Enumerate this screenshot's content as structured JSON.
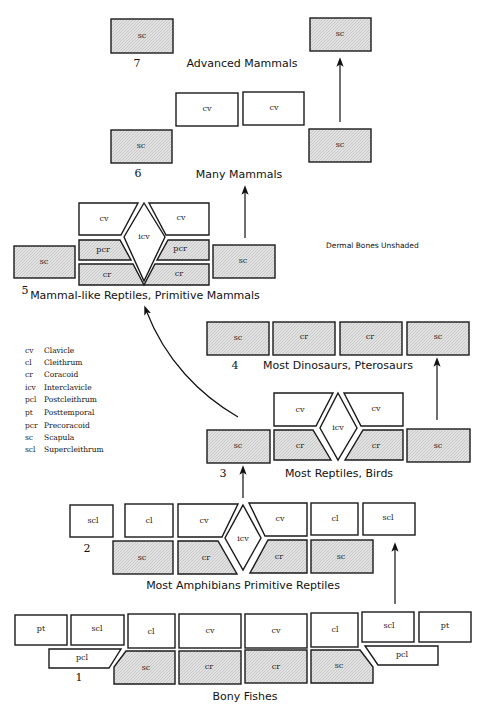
{
  "figure": {
    "note": "Dermal Bones Unshaded",
    "stages": [
      {
        "number": "7",
        "title": "Advanced Mammals"
      },
      {
        "number": "6",
        "title": "Many Mammals"
      },
      {
        "number": "5",
        "title": "Mammal-like Reptiles, Primitive Mammals"
      },
      {
        "number": "4",
        "title": "Most Dinosaurs, Pterosaurs"
      },
      {
        "number": "3",
        "title": "Most Reptiles, Birds"
      },
      {
        "number": "2",
        "title": "Most Amphibians  Primitive Reptiles"
      },
      {
        "number": "1",
        "title": "Bony Fishes"
      }
    ],
    "legend": [
      {
        "abbr": "cv",
        "name": "Clavicle"
      },
      {
        "abbr": "cl",
        "name": "Cleithrum"
      },
      {
        "abbr": "cr",
        "name": "Coracoid"
      },
      {
        "abbr": "icv",
        "name": "Interclavicle"
      },
      {
        "abbr": "pcl",
        "name": "Postcleithrum"
      },
      {
        "abbr": "pt",
        "name": "Posttemporal"
      },
      {
        "abbr": "pcr",
        "name": "Precoracoid"
      },
      {
        "abbr": "sc",
        "name": "Scapula"
      },
      {
        "abbr": "scl",
        "name": "Supercleithrum"
      }
    ],
    "bones": {
      "sc": "sc",
      "cv": "cv",
      "cr": "cr",
      "icv": "icv",
      "pcr": "pcr",
      "cl": "cl",
      "scl": "scl",
      "pt": "pt",
      "pcl": "pcl"
    },
    "colors": {
      "shaded": "#d9d9d9",
      "outline": "#1a1a1a"
    }
  }
}
